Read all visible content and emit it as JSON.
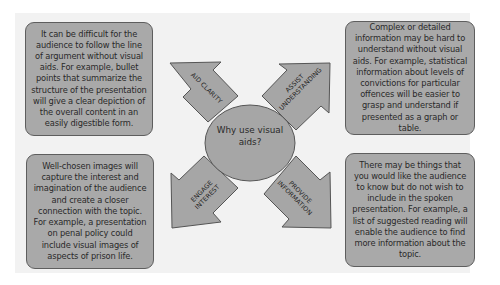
{
  "diagram": {
    "hub": {
      "label": "Why use visual aids?"
    },
    "colors": {
      "box_fill": "#a9a9a9",
      "box_border": "#5e5e5e",
      "panel_background": "#f2f2f2",
      "text": "#2a2a2a"
    },
    "branches": [
      {
        "id": "aid-clarity",
        "arrow_label": "AID CLARITY",
        "direction": "up-left",
        "text": "It can be difficult for the audience to follow the line of argument without visual aids. For example, bullet points that summarize the structure of the presentation will give a clear depiction of the overall content in an easily digestible form."
      },
      {
        "id": "assist-understanding",
        "arrow_label": "ASSIST UNDERSTANDING",
        "arrow_label_lines": [
          "ASSIST",
          "UNDERSTANDING"
        ],
        "direction": "up-right",
        "text": "Complex or detailed information may be hard to understand without visual aids. For example, statistical information about levels of convictions for particular offences will be easier to grasp and understand if presented as a graph or table."
      },
      {
        "id": "engage-interest",
        "arrow_label": "ENGAGE INTEREST",
        "arrow_label_lines": [
          "ENGAGE",
          "INTEREST"
        ],
        "direction": "down-left",
        "text": "Well-chosen images will capture the interest and imagination of the audience and create a closer connection with the topic. For example, a presentation on penal policy could include visual images of aspects of prison life."
      },
      {
        "id": "provide-information",
        "arrow_label": "PROVIDE INFORMATION",
        "arrow_label_lines": [
          "PROVIDE",
          "INFORMATION"
        ],
        "direction": "down-right",
        "text": "There may be things that you would like the audience to know but do not wish to include in the spoken presentation. For example, a list of suggested reading will enable the audience to find more information about the topic."
      }
    ]
  }
}
